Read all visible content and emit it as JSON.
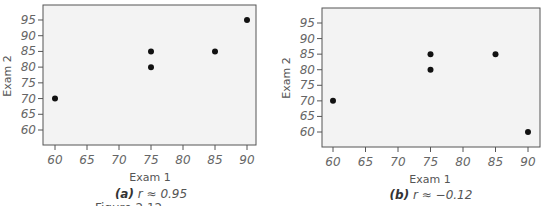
{
  "figure_fragment": "Figure 2.12",
  "chart_data": [
    {
      "type": "scatter",
      "panel": "a",
      "caption_label": "(a)",
      "caption_text": "r ≈ 0.95",
      "xlabel": "Exam 1",
      "ylabel": "Exam 2",
      "xticks": [
        60,
        65,
        70,
        75,
        80,
        85,
        90
      ],
      "yticks": [
        60,
        65,
        70,
        75,
        80,
        85,
        90,
        95
      ],
      "xlim": [
        58,
        92
      ],
      "ylim": [
        55,
        99
      ],
      "grid": false,
      "points": [
        {
          "x": 60,
          "y": 70
        },
        {
          "x": 75,
          "y": 85
        },
        {
          "x": 75,
          "y": 80
        },
        {
          "x": 85,
          "y": 85
        },
        {
          "x": 90,
          "y": 95
        }
      ],
      "r": 0.95
    },
    {
      "type": "scatter",
      "panel": "b",
      "caption_label": "(b)",
      "caption_text": "r ≈ −0.12",
      "xlabel": "Exam 1",
      "ylabel": "Exam 2",
      "xticks": [
        60,
        65,
        70,
        75,
        80,
        85,
        90
      ],
      "yticks": [
        60,
        65,
        70,
        75,
        80,
        85,
        90,
        95
      ],
      "xlim": [
        58,
        92
      ],
      "ylim": [
        55,
        99
      ],
      "grid": false,
      "points": [
        {
          "x": 60,
          "y": 70
        },
        {
          "x": 75,
          "y": 85
        },
        {
          "x": 75,
          "y": 80
        },
        {
          "x": 85,
          "y": 85
        },
        {
          "x": 90,
          "y": 60
        }
      ],
      "r": -0.12
    }
  ],
  "style": {
    "plot_bg": "#f3f3f3",
    "frame_color": "#555555",
    "point_color": "#111111"
  }
}
